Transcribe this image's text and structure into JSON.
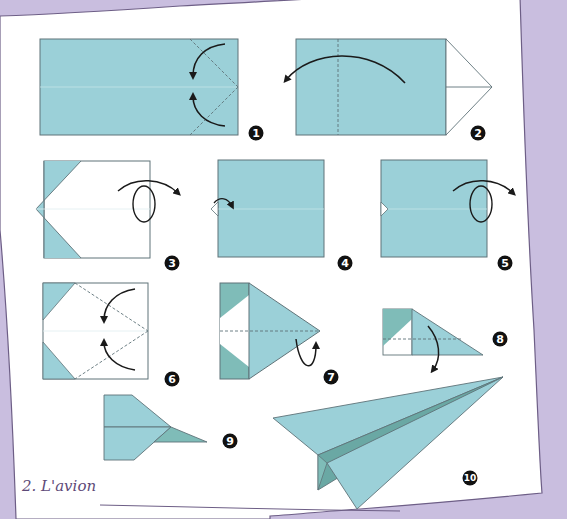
{
  "page": {
    "title": "2. L'avion",
    "background_color": "#c9bedf",
    "paper_color": "#ffffff",
    "paper_edge_color": "#6d5e86"
  },
  "colors": {
    "paper_blue": "#9bd0d8",
    "paper_blue_dark": "#7fbcb8",
    "paper_blue_shadow": "#6aa8a4",
    "outline": "#5f7378",
    "fold_line": "#5f7378",
    "arrow": "#1a1a1a",
    "badge": "#111111",
    "badge_text": "#ffffff"
  },
  "steps": [
    {
      "number": "1",
      "description": "Fold the two right corners to the centre line (valley folds)"
    },
    {
      "number": "2",
      "description": "Fold the right point over to the left along the dashed line"
    },
    {
      "number": "3",
      "description": "Turn the model over"
    },
    {
      "number": "4",
      "description": "Fold the small tip back"
    },
    {
      "number": "5",
      "description": "Turn the model over"
    },
    {
      "number": "6",
      "description": "Fold the two corners to the centre line"
    },
    {
      "number": "7",
      "description": "Fold the model in half along the dashed line (mountain fold)"
    },
    {
      "number": "8",
      "description": "Fold the wing down along the dashed line"
    },
    {
      "number": "9",
      "description": "Repeat on the other side"
    },
    {
      "number": "10",
      "description": "Finished paper airplane"
    }
  ]
}
